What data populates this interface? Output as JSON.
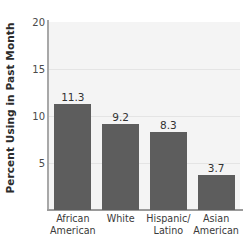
{
  "chart_data": {
    "type": "bar",
    "title": "",
    "xlabel": "",
    "ylabel": "Percent Using in Past Month",
    "categories": [
      "African American",
      "White",
      "Hispanic/ Latino",
      "Asian American"
    ],
    "category_lines": [
      [
        "African",
        "American"
      ],
      [
        "White",
        ""
      ],
      [
        "Hispanic/",
        "Latino"
      ],
      [
        "Asian",
        "American"
      ]
    ],
    "values": [
      11.3,
      9.2,
      8.3,
      3.7
    ],
    "value_labels": [
      "11.3",
      "9.2",
      "8.3",
      "3.7"
    ],
    "ylim": [
      0,
      20
    ],
    "yticks": [
      5,
      10,
      15,
      20
    ],
    "ytick_labels": [
      "5",
      "10",
      "15",
      "20"
    ],
    "grid": true,
    "legend": null,
    "colors": {
      "bar": "#5d5d5d",
      "plot_background": "#f4f4f4",
      "gridline": "#e4e4e4",
      "axis": "#9a9a9a",
      "text": "#323232"
    }
  }
}
